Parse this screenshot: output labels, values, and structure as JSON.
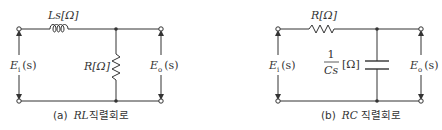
{
  "diagrams": [
    {
      "id": "a",
      "caption_prefix": "(a)",
      "caption_italic": "RL",
      "caption_suffix": "직렬회로",
      "series_element_label": "Ls[Ω]",
      "shunt_element_label": "R[Ω]",
      "input_label_main": "E",
      "input_label_sub": "i",
      "input_label_arg": "(s)",
      "output_label_main": "E",
      "output_label_sub": "o",
      "output_label_arg": "(s)"
    },
    {
      "id": "b",
      "caption_prefix": "(b)",
      "caption_italic": "RC",
      "caption_suffix": " 직렬회로",
      "series_element_label": "R[Ω]",
      "shunt_label_num": "1",
      "shunt_label_den": "Cs",
      "shunt_label_unit": "[Ω]",
      "input_label_main": "E",
      "input_label_sub": "i",
      "input_label_arg": "(s)",
      "output_label_main": "E",
      "output_label_sub": "o",
      "output_label_arg": "(s)"
    }
  ]
}
